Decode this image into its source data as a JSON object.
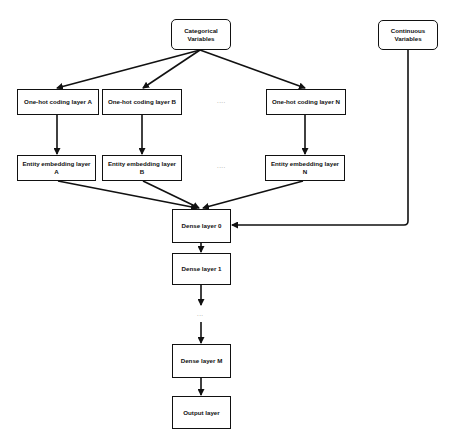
{
  "diagram": {
    "type": "flowchart",
    "nodes": {
      "categorical": {
        "label": "Categorical\nVariables",
        "line1": "Categorical",
        "line2": "Variables"
      },
      "continuous": {
        "label": "Continuous\nVariables",
        "line1": "Continuous",
        "line2": "Variables"
      },
      "onehot_a": {
        "label": "One-hot coding layer A"
      },
      "onehot_b": {
        "label": "One-hot coding layer B"
      },
      "onehot_n": {
        "label": "One-hot coding layer N"
      },
      "embed_a": {
        "label": "Entity embedding layer A"
      },
      "embed_b": {
        "label": "Entity embedding layer B"
      },
      "embed_n": {
        "label": "Entity embedding layer N"
      },
      "dense_0": {
        "label": "Dense layer 0"
      },
      "dense_1": {
        "label": "Dense layer 1"
      },
      "dense_m": {
        "label": "Dense layer M"
      },
      "output": {
        "label": "Output layer"
      }
    },
    "ellipses": {
      "onehot_row": "....",
      "embed_row": "....",
      "dense_stack": "..."
    },
    "edges": [
      [
        "categorical",
        "onehot_a"
      ],
      [
        "categorical",
        "onehot_b"
      ],
      [
        "categorical",
        "onehot_n"
      ],
      [
        "onehot_a",
        "embed_a"
      ],
      [
        "onehot_b",
        "embed_b"
      ],
      [
        "onehot_n",
        "embed_n"
      ],
      [
        "embed_a",
        "dense_0"
      ],
      [
        "embed_b",
        "dense_0"
      ],
      [
        "embed_n",
        "dense_0"
      ],
      [
        "continuous",
        "dense_0"
      ],
      [
        "dense_0",
        "dense_1"
      ],
      [
        "dense_1",
        "..."
      ],
      [
        "...",
        "dense_m"
      ],
      [
        "dense_m",
        "output"
      ]
    ],
    "colors": {
      "stroke": "#111111",
      "fill": "#ffffff",
      "ellipsis": "#777777"
    }
  }
}
